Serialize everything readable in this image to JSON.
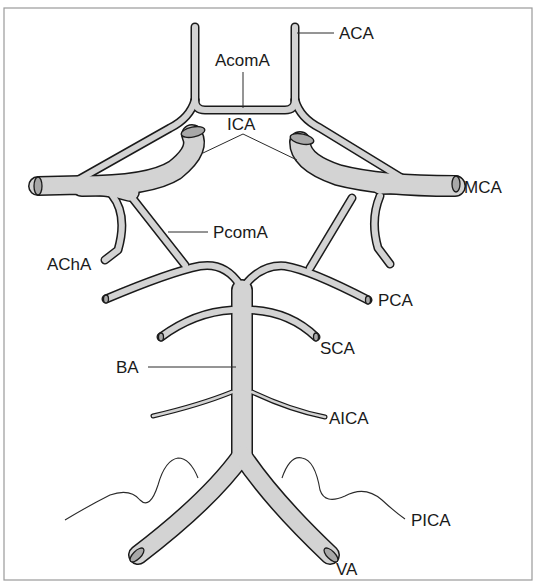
{
  "diagram": {
    "colors": {
      "vessel_fill": "#d3d3d3",
      "vessel_outline": "#1a1a1a",
      "cut_end": "#a8a8a8",
      "frame": "#9a9a9a",
      "background": "#ffffff"
    },
    "labels": {
      "aca": "ACA",
      "acoma": "AcomA",
      "ica": "ICA",
      "mca": "MCA",
      "pcoma": "PcomA",
      "acha": "AChA",
      "pca": "PCA",
      "sca": "SCA",
      "ba": "BA",
      "aica": "AICA",
      "pica": "PICA",
      "va": "VA"
    },
    "vessels": [
      {
        "abbr": "ACA",
        "name": "Anterior cerebral artery"
      },
      {
        "abbr": "AcomA",
        "name": "Anterior communicating artery"
      },
      {
        "abbr": "ICA",
        "name": "Internal carotid artery"
      },
      {
        "abbr": "MCA",
        "name": "Middle cerebral artery"
      },
      {
        "abbr": "PcomA",
        "name": "Posterior communicating artery"
      },
      {
        "abbr": "AChA",
        "name": "Anterior choroidal artery"
      },
      {
        "abbr": "PCA",
        "name": "Posterior cerebral artery"
      },
      {
        "abbr": "SCA",
        "name": "Superior cerebellar artery"
      },
      {
        "abbr": "BA",
        "name": "Basilar artery"
      },
      {
        "abbr": "AICA",
        "name": "Anterior inferior cerebellar artery"
      },
      {
        "abbr": "PICA",
        "name": "Posterior inferior cerebellar artery"
      },
      {
        "abbr": "VA",
        "name": "Vertebral artery"
      }
    ]
  }
}
